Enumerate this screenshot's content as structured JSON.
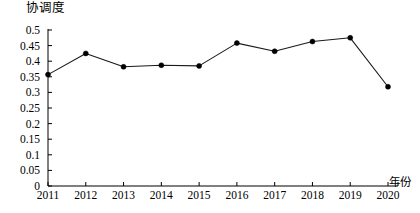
{
  "chart_data": {
    "type": "line",
    "title": "",
    "xlabel": "年份",
    "ylabel": "协调度",
    "categories": [
      "2011",
      "2012",
      "2013",
      "2014",
      "2015",
      "2016",
      "2017",
      "2018",
      "2019",
      "2020"
    ],
    "values": [
      0.357,
      0.425,
      0.382,
      0.387,
      0.385,
      0.458,
      0.432,
      0.463,
      0.475,
      0.318
    ],
    "series": [
      {
        "name": "协调度",
        "values": [
          0.357,
          0.425,
          0.382,
          0.387,
          0.385,
          0.458,
          0.432,
          0.463,
          0.475,
          0.318
        ]
      }
    ],
    "ylim": [
      0,
      0.5
    ],
    "yticks": [
      "0",
      "0.05",
      "0.1",
      "0.15",
      "0.2",
      "0.25",
      "0.3",
      "0.35",
      "0.4",
      "0.45",
      "0.5"
    ],
    "ytick_values": [
      0,
      0.05,
      0.1,
      0.15,
      0.2,
      0.25,
      0.3,
      0.35,
      0.4,
      0.45,
      0.5
    ],
    "xticks": [
      "2011",
      "2012",
      "2013",
      "2014",
      "2015",
      "2016",
      "2017",
      "2018",
      "2019",
      "2020"
    ],
    "grid": false,
    "legend": false,
    "legend_position": "none",
    "marker": "circle",
    "line_color": "#1a1a1a",
    "marker_color": "#000000",
    "axis_color": "#000000",
    "background": "#ffffff"
  }
}
